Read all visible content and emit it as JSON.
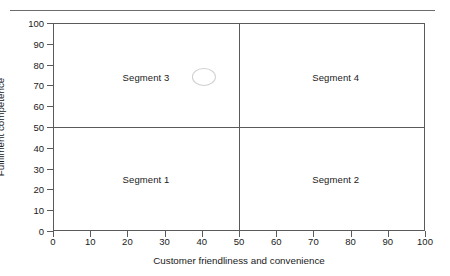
{
  "figure": {
    "background_color": "#ffffff",
    "rule_color": "#6d6d6d",
    "axis_color": "#5a5a5a",
    "text_color": "#1a1a1a",
    "marker_color": "#cfcfcf"
  },
  "chart_data": {
    "type": "scatter",
    "title": "",
    "subtitle": "",
    "xlabel": "Customer friendliness and convenience",
    "ylabel": "Fulfilment competence",
    "xlim": [
      0,
      100
    ],
    "ylim": [
      0,
      100
    ],
    "xticks": [
      0,
      10,
      20,
      30,
      40,
      50,
      60,
      70,
      80,
      90,
      100
    ],
    "yticks": [
      0,
      10,
      20,
      30,
      40,
      50,
      60,
      70,
      80,
      90,
      100
    ],
    "xticklabels": [
      "0",
      "10",
      "20",
      "30",
      "40",
      "50",
      "60",
      "70",
      "80",
      "90",
      "100"
    ],
    "yticklabels": [
      "0",
      "10",
      "20",
      "30",
      "40",
      "50",
      "60",
      "70",
      "80",
      "90",
      "100"
    ],
    "grid": false,
    "legend": null,
    "quadrant_dividers": {
      "x": 50,
      "y": 50
    },
    "annotations": [
      {
        "text": "Segment 1",
        "x": 25,
        "y": 25,
        "quadrant": "bottom-left"
      },
      {
        "text": "Segment 2",
        "x": 76,
        "y": 25,
        "quadrant": "bottom-right"
      },
      {
        "text": "Segment 3",
        "x": 25,
        "y": 74,
        "quadrant": "top-left"
      },
      {
        "text": "Segment 4",
        "x": 76,
        "y": 74,
        "quadrant": "top-right"
      }
    ],
    "series": [
      {
        "name": "",
        "marker": "ellipse-outline",
        "points": [
          {
            "x": 40.6,
            "y": 74,
            "width": 6.5,
            "height": 8.7
          }
        ]
      }
    ]
  }
}
